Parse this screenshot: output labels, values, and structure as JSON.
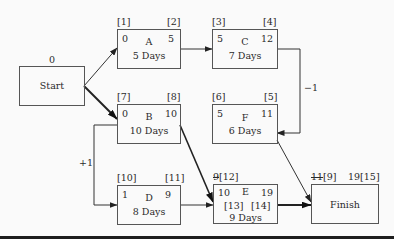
{
  "diagram": {
    "type": "precedence network with lags",
    "nodes": {
      "start": {
        "name": "Start",
        "top_label": "0"
      },
      "A": {
        "name": "A",
        "duration": "5 Days",
        "es": "0",
        "ef": "5",
        "tl_ref": "[1]",
        "tr_ref": "[2]"
      },
      "B": {
        "name": "B",
        "duration": "10 Days",
        "es": "0",
        "ef": "10",
        "tl_ref": "[7]",
        "tr_ref": "[8]"
      },
      "C": {
        "name": "C",
        "duration": "7 Days",
        "es": "5",
        "ef": "12",
        "tl_ref": "[3]",
        "tr_ref": "[4]"
      },
      "F": {
        "name": "F",
        "duration": "6 Days",
        "es": "5",
        "ef": "11",
        "tl_ref": "[6]",
        "tr_ref": "[5]"
      },
      "D": {
        "name": "D",
        "duration": "8 Days",
        "es": "1",
        "ef": "9",
        "tl_ref": "[10]",
        "tr_ref": "[11]"
      },
      "E": {
        "name": "E",
        "duration": "9 Days",
        "es": "10",
        "ef": "19",
        "tl_struck": "9",
        "tl_ref": "[12]",
        "mid_left_ref": "[13]",
        "mid_right_ref": "[14]"
      },
      "finish": {
        "name": "Finish",
        "tl_struck": "11",
        "tl_ref": "[9]",
        "tr_value": "19",
        "tr_ref": "[15]"
      }
    },
    "lags": {
      "c_to_f": "−1",
      "b_to_d": "+1"
    },
    "links": [
      {
        "from": "Start",
        "to": "A",
        "critical": false
      },
      {
        "from": "Start",
        "to": "B",
        "critical": true
      },
      {
        "from": "A",
        "to": "C",
        "critical": false
      },
      {
        "from": "C",
        "to": "F",
        "lag": "−1",
        "critical": false
      },
      {
        "from": "B",
        "to": "D",
        "lag": "+1",
        "critical": false
      },
      {
        "from": "B",
        "to": "E",
        "critical": true
      },
      {
        "from": "D",
        "to": "E",
        "critical": false
      },
      {
        "from": "E",
        "to": "Finish",
        "critical": true
      },
      {
        "from": "F",
        "to": "Finish",
        "critical": false
      }
    ]
  }
}
